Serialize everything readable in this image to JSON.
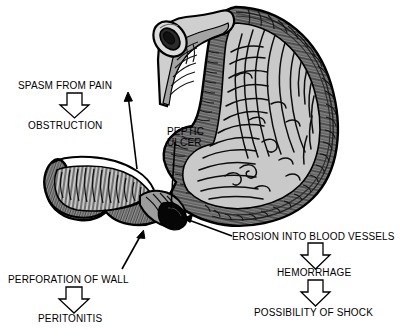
{
  "diagram": {
    "background_color": "#ffffff",
    "ink_color": "#000000",
    "fill_light": "#c9c9c9",
    "fill_mid": "#9a9a9a",
    "fill_dark": "#3a3a3a"
  },
  "labels": {
    "spasm_from_pain": "SPASM FROM PAIN",
    "obstruction": "OBSTRUCTION",
    "peptic_ulcer_line1": "PEPTIC",
    "peptic_ulcer_line2": "ULCER",
    "erosion_into_blood_vessels": "EROSION INTO BLOOD VESSELS",
    "perforation_of_wall": "PERFORATION OF WALL",
    "peritonitis": "PERITONITIS",
    "hemorrhage": "HEMORRHAGE",
    "possibility_of_shock": "POSSIBILITY OF SHOCK"
  },
  "anatomy": {
    "esophagus": "esophagus-cut-end",
    "stomach_body": "stomach-body-cross-section",
    "rugae": "gastric-folds",
    "pylorus": "pyloric-canal",
    "duodenum": "duodenum-cut-end",
    "ulcer_crater": "ulcer-crater"
  },
  "flow": {
    "chain_left": [
      "SPASM FROM PAIN",
      "OBSTRUCTION"
    ],
    "chain_lower_left": [
      "PERFORATION OF WALL",
      "PERITONITIS"
    ],
    "chain_lower_right": [
      "EROSION INTO BLOOD VESSELS",
      "HEMORRHAGE",
      "POSSIBILITY OF SHOCK"
    ]
  }
}
